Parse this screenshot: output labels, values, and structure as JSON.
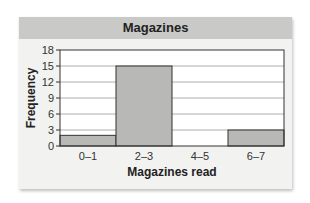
{
  "chart_data": {
    "type": "bar",
    "title": "Magazines",
    "xlabel": "Magazines read",
    "ylabel": "Frequency",
    "categories": [
      "0–1",
      "2–3",
      "4–5",
      "6–7"
    ],
    "values": [
      2,
      15,
      0,
      3
    ],
    "ylim": [
      0,
      18
    ],
    "yticks": [
      0,
      3,
      6,
      9,
      12,
      15,
      18
    ],
    "grid": true,
    "legend": "none",
    "bar_color": "#b8b8b6",
    "panel_color": "#f2f2f0",
    "title_band_color": "#c9c9c7"
  }
}
